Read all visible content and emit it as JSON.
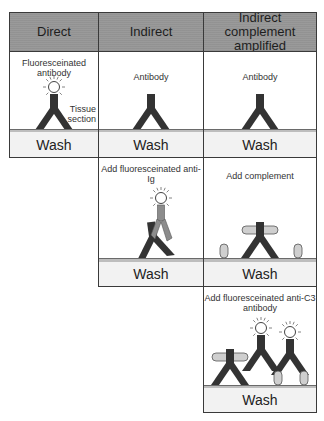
{
  "columns": [
    {
      "header": "Direct"
    },
    {
      "header": "Indirect"
    },
    {
      "header": "Indirect complement amplified"
    }
  ],
  "direct": {
    "step1_label": "Fluoresceinated antibody",
    "tissue_label": "Tissue section",
    "wash1": "Wash"
  },
  "indirect": {
    "step1_label": "Antibody",
    "wash1": "Wash",
    "step2_label": "Add fluoresceinated anti-Ig",
    "wash2": "Wash"
  },
  "complement": {
    "step1_label": "Antibody",
    "wash1": "Wash",
    "step2_label": "Add complement",
    "wash2": "Wash",
    "step3_label": "Add fluoresceinated anti-C3 antibody",
    "wash3": "Wash"
  },
  "colors": {
    "header_bg": "#9a9a9a",
    "antibody_dark": "#333333",
    "anti_ig_gray": "#8c8c8c",
    "complement_fill": "#cfcfcf",
    "tissue_strip": "#bdbdbd",
    "wash_bg": "#f2f2f2"
  }
}
